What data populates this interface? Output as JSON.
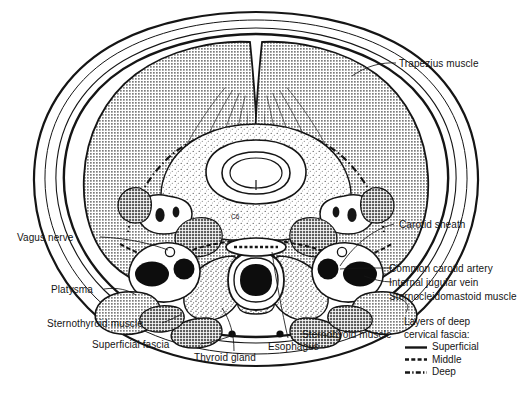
{
  "figure": {
    "type": "anatomical-cross-section",
    "region": "neck",
    "vertebral_level_label": "C6",
    "view": "axial / transverse section, superior view"
  },
  "labels": {
    "trapezius": "Trapezius muscle",
    "carotid_sheath": "Carotid sheath",
    "common_carotid_artery": "Common carotid artery",
    "internal_jugular_vein": "Internal jugular vein",
    "sternocleidomastoid": "Sternocleidomastoid muscle",
    "sternohyoid_right": "Sternohyoid muscle",
    "vagus_nerve": "Vagus nerve",
    "platysma": "Platysma",
    "sternothyroid": "Sternothyroid muscle",
    "superficial_fascia": "Superficial fascia",
    "thyroid_gland": "Thyroid gland",
    "esophagus": "Esophagus"
  },
  "legend": {
    "title_line1": "Layers of deep",
    "title_line2": "cervical fascia:",
    "entries": [
      {
        "name": "Superficial",
        "style": "solid"
      },
      {
        "name": "Middle",
        "style": "dashed"
      },
      {
        "name": "Deep",
        "style": "dash-dot"
      }
    ]
  },
  "colors": {
    "ink": "#151515",
    "muscle_fill": "#8f8f8f",
    "muscle_fill_dark": "#6e6e6e",
    "lumen_black": "#0d0d0d",
    "background": "#ffffff",
    "stipple": "#6a6a6a"
  }
}
